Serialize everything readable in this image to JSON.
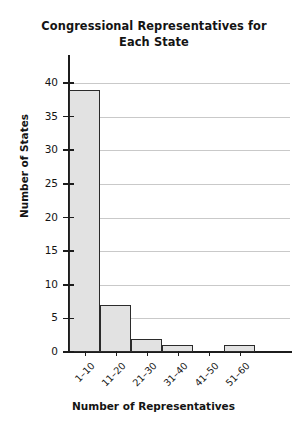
{
  "chart_data": {
    "type": "bar",
    "title": "Congressional Representatives for Each State",
    "title_line1": "Congressional Representatives for",
    "title_line2": "Each State",
    "xlabel": "Number of Representatives",
    "ylabel": "Number of States",
    "categories": [
      "1–10",
      "11–20",
      "21–30",
      "31–40",
      "41–50",
      "51–60"
    ],
    "values": [
      39,
      7,
      2,
      1,
      0,
      1
    ],
    "ylim": [
      0,
      40
    ],
    "ytick_labels": [
      "0",
      "5",
      "10",
      "15",
      "20",
      "25",
      "30",
      "35",
      "40"
    ],
    "ytick_values": [
      0,
      5,
      10,
      15,
      20,
      25,
      30,
      35,
      40
    ],
    "grid": "horizontal",
    "legend": "none",
    "bar_fill_color": "#e2e2e2",
    "bar_edge_color": "#2b2b2b",
    "axis_color": "#1c1c1c",
    "grid_color": "#c9c9c9",
    "background_color": "#ffffff"
  }
}
